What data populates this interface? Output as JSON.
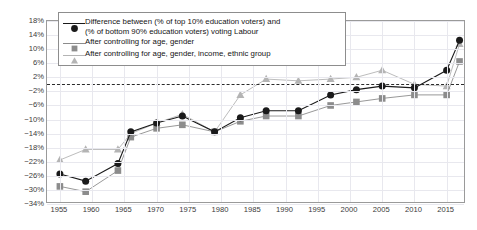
{
  "chart_data": {
    "type": "line",
    "title": "",
    "xlabel": "",
    "ylabel": "",
    "xlim": [
      1953,
      2018
    ],
    "ylim": [
      -34,
      18
    ],
    "ytick_step": 4,
    "xtick_step": 5,
    "grid": true,
    "legend_position": "top-left-inside",
    "zero_reference_line": 0,
    "yticks": [
      "18%",
      "14%",
      "10%",
      "6%",
      "2%",
      "-2%",
      "-6%",
      "-10%",
      "-14%",
      "-18%",
      "-22%",
      "-26%",
      "-30%",
      "-34%"
    ],
    "xticks": [
      "1955",
      "1960",
      "1965",
      "1970",
      "1975",
      "1980",
      "1985",
      "1990",
      "1995",
      "2000",
      "2005",
      "2010",
      "2015"
    ],
    "series": [
      {
        "name": "Difference between (% of top 10% education voters) and (% of bottom 90% education voters) voting Labour",
        "marker": "circle",
        "color": "#1a1a1a",
        "line_color": "#1a1a1a",
        "x": [
          1955,
          1959,
          1964,
          1966,
          1970,
          1974,
          1979,
          1983,
          1987,
          1992,
          1997,
          2001,
          2005,
          2010,
          2015,
          2017
        ],
        "y": [
          -25.5,
          -27.5,
          -22.5,
          -13.5,
          -11.0,
          -9.0,
          -13.5,
          -9.5,
          -7.5,
          -7.5,
          -3.0,
          -1.5,
          -0.5,
          -1.0,
          4.0,
          12.5
        ]
      },
      {
        "name": "After controlling for age, gender",
        "marker": "square",
        "color": "#8c8c8c",
        "line_color": "#8c8c8c",
        "x": [
          1955,
          1959,
          1964,
          1966,
          1970,
          1974,
          1979,
          1983,
          1987,
          1992,
          1997,
          2001,
          2005,
          2010,
          2015,
          2017
        ],
        "y": [
          -29.0,
          -30.5,
          -24.5,
          -15.0,
          -12.5,
          -11.5,
          -13.5,
          -10.5,
          -9.0,
          -9.0,
          -6.0,
          -5.0,
          -4.0,
          -3.0,
          -3.0,
          6.5
        ]
      },
      {
        "name": "After controlling for age, gender, income, ethnic group",
        "marker": "triangle",
        "color": "#b4b4b4",
        "line_color": "#b4b4b4",
        "x": [
          1955,
          1959,
          1964,
          1966,
          1970,
          1974,
          1979,
          1983,
          1987,
          1992,
          1997,
          2001,
          2005,
          2010,
          2015,
          2017
        ],
        "y": [
          -21.5,
          -18.5,
          -18.5,
          -14.0,
          -11.0,
          -8.5,
          -13.5,
          -3.0,
          1.5,
          1.0,
          1.5,
          2.0,
          4.0,
          0.0,
          -0.5,
          11.5
        ]
      }
    ]
  },
  "legend": {
    "entries": [
      {
        "line1": "Difference between (% of top 10% education voters) and",
        "line2": "(% of bottom 90% education voters) voting Labour",
        "marker": "circle-marker",
        "color": "#1a1a1a"
      },
      {
        "line1": "After controlling for age, gender",
        "line2": "",
        "marker": "square-marker",
        "color": "#8c8c8c"
      },
      {
        "line1": "After controlling for age, gender, income, ethnic group",
        "line2": "",
        "marker": "triangle-marker",
        "color": "#b4b4b4"
      }
    ]
  },
  "colors": {
    "series1": "#1a1a1a",
    "series2": "#8c8c8c",
    "series3": "#b4b4b4",
    "grid": "#e8e8ee",
    "frame": "#9a9a9a",
    "zero_line": "#2b2b2b"
  }
}
